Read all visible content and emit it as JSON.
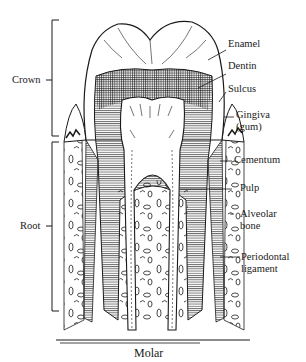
{
  "diagram": {
    "title": "Molar",
    "left_labels": {
      "crown": "Crown",
      "root": "Root"
    },
    "right_labels": {
      "enamel": "Enamel",
      "dentin": "Dentin",
      "sulcus": "Sulcus",
      "gingiva_1": "Gingiva",
      "gingiva_2": "(gum)",
      "cementum": "Cementum",
      "pulp": "Pulp",
      "alveolar_1": "Alveolar",
      "alveolar_2": "bone",
      "periodontal_1": "Periodontal",
      "periodontal_2": "ligament"
    },
    "colors": {
      "ink": "#1a1a1a",
      "background": "#ffffff"
    }
  }
}
